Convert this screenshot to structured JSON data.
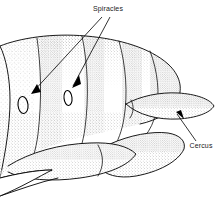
{
  "figure": {
    "type": "scientific-line-drawing",
    "background_color": "#ffffff",
    "ink_color": "#000000",
    "shading_style": "stipple"
  },
  "labels": [
    {
      "id": "spiracles",
      "text": "Spiracles",
      "x": 108,
      "y": 11,
      "anchor": "middle",
      "leader_count": 2,
      "points_to": [
        "spiracle-anterior",
        "spiracle-posterior"
      ]
    },
    {
      "id": "cercus",
      "text": "Cercus",
      "x": 201,
      "y": 148,
      "anchor": "middle",
      "leader_count": 1,
      "points_to": [
        "cercus-tip"
      ]
    }
  ],
  "structures": [
    {
      "id": "spiracle-anterior",
      "name": "spiracle",
      "cx": 23,
      "cy": 105,
      "rx": 5.0,
      "ry": 8.5,
      "rotation": -6
    },
    {
      "id": "spiracle-posterior",
      "name": "spiracle",
      "cx": 68,
      "cy": 98,
      "rx": 4.0,
      "ry": 7.5,
      "rotation": -6
    },
    {
      "id": "cercus",
      "name": "cercus",
      "description": "elongate tapering appendage projecting posteriorly"
    },
    {
      "id": "tergites",
      "name": "abdominal tergites",
      "count": 5
    },
    {
      "id": "sternites",
      "name": "abdominal sternites",
      "count": 3
    }
  ],
  "leaders": {
    "spiracle_anterior_line": "M 102 17 L 32 93",
    "spiracle_anterior_arrow": "M 32 93 L 40 93 L 36 86 Z",
    "spiracle_posterior_line": "M 110 17 L 73 86",
    "spiracle_posterior_arrow": "M 73 86 L 80 85 L 78 78 Z",
    "cercus_line": "M 196 141 L 177 115",
    "cercus_arrow": "M 177 115 L 184 118 L 182 111 Z"
  }
}
